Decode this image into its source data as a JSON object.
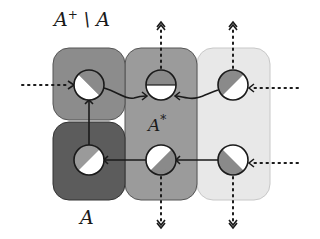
{
  "diagram": {
    "labels": {
      "top_left_base": "A",
      "top_left_sup": "+",
      "top_left_rest": " \\ A",
      "middle_base": "A",
      "middle_sup": "*",
      "bottom": "A"
    },
    "regions": [
      {
        "id": "A-plus-minus-A",
        "fill": "#8c8c8c",
        "x": 53,
        "y": 48,
        "w": 72,
        "h": 72
      },
      {
        "id": "A",
        "fill": "#5c5c5c",
        "x": 53,
        "y": 122,
        "w": 72,
        "h": 78
      },
      {
        "id": "A-star",
        "fill": "#9b9b9b",
        "x": 125,
        "y": 48,
        "w": 72,
        "h": 152
      },
      {
        "id": "outside",
        "fill": "#e8e8e8",
        "x": 197,
        "y": 48,
        "w": 73,
        "h": 152
      }
    ],
    "nodes": [
      {
        "id": "n11",
        "cx": 89,
        "cy": 85,
        "split": "diag-tr"
      },
      {
        "id": "n12",
        "cx": 161,
        "cy": 85,
        "split": "top-half"
      },
      {
        "id": "n13",
        "cx": 233,
        "cy": 85,
        "split": "diag-tl"
      },
      {
        "id": "n21",
        "cx": 89,
        "cy": 160,
        "split": "diag-tl"
      },
      {
        "id": "n22",
        "cx": 161,
        "cy": 160,
        "split": "diag-br"
      },
      {
        "id": "n23",
        "cx": 233,
        "cy": 160,
        "split": "diag-bl"
      }
    ],
    "colors": {
      "node_fill_dark": "#8a8a8a",
      "node_fill_light": "#ffffff",
      "stroke": "#1a1a1a"
    }
  }
}
